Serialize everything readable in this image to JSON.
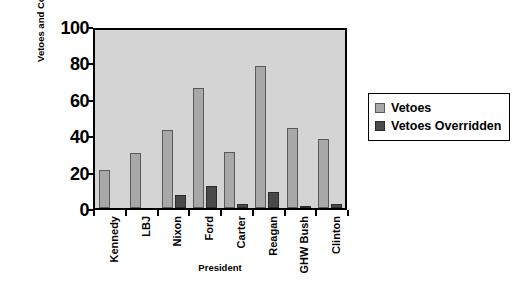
{
  "chart_data": {
    "type": "bar",
    "title": "",
    "xlabel": "President",
    "ylabel": "Vetoes and Congressional Overrides",
    "categories": [
      "Kennedy",
      "LBJ",
      "Nixon",
      "Ford",
      "Carter",
      "Reagan",
      "GHW Bush",
      "Clinton"
    ],
    "series": [
      {
        "name": "Vetoes",
        "color": "#a8a8a8",
        "values": [
          21,
          30,
          43,
          66,
          31,
          78,
          44,
          38
        ]
      },
      {
        "name": "Vetoes Overridden",
        "color": "#4a4a4a",
        "values": [
          0,
          0,
          7,
          12,
          2,
          9,
          1,
          2
        ]
      }
    ],
    "ylim": [
      0,
      100
    ],
    "yticks": [
      0,
      20,
      40,
      60,
      80,
      100
    ],
    "ytick_labels": [
      "0",
      "20",
      "40",
      "60",
      "80",
      "100"
    ],
    "grid": false,
    "legend_position": "right",
    "plot_background": "#d4d4d4"
  },
  "legend": {
    "entries": [
      {
        "label": "Vetoes"
      },
      {
        "label": "Vetoes Overridden"
      }
    ]
  }
}
